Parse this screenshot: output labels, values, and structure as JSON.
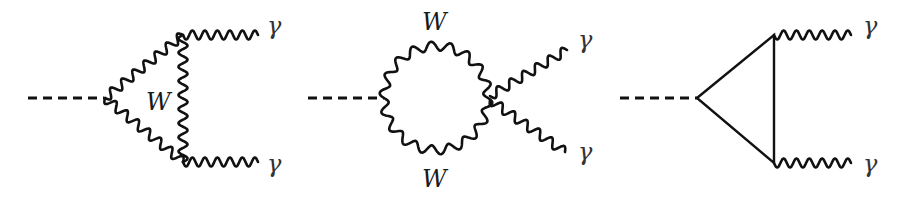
{
  "figure": {
    "type": "feynman-diagrams",
    "diagrams": [
      {
        "id": "w-triangle",
        "incoming": "scalar (dashed)",
        "loop": "W boson triangle",
        "labels": {
          "loop": "W",
          "photon_top": "γ",
          "photon_bottom": "γ"
        }
      },
      {
        "id": "w-bubble",
        "incoming": "scalar (dashed)",
        "loop": "W boson bubble with quartic vertex",
        "labels": {
          "loop_top": "W",
          "loop_bottom": "W",
          "photon_top": "γ",
          "photon_bottom": "γ"
        }
      },
      {
        "id": "fermion-triangle",
        "incoming": "scalar (dashed)",
        "loop": "fermion triangle",
        "labels": {
          "photon_top": "γ",
          "photon_bottom": "γ"
        }
      }
    ]
  }
}
